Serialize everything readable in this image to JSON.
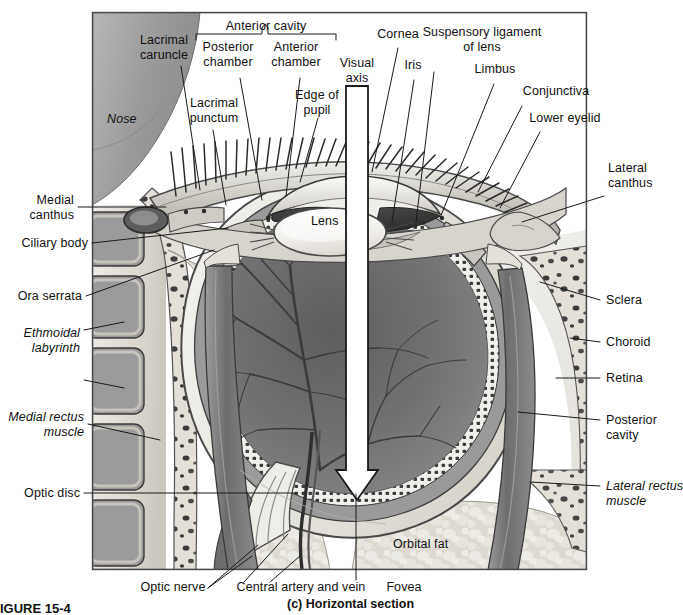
{
  "figure": {
    "number": "FIGURE 15-4",
    "caption": "(c) Horizontal section",
    "panel_letter": "(c)"
  },
  "diagram": {
    "frame": {
      "x": 92,
      "y": 12,
      "width": 495,
      "height": 558
    },
    "bracket_label": "Anterior cavity"
  },
  "labels": {
    "lacrimal_caruncle": "Lacrimal\ncaruncle",
    "lacrimal_punctum": "Lacrimal\npunctum",
    "nose": "Nose",
    "anterior_cavity": "Anterior cavity",
    "posterior_chamber": "Posterior\nchamber",
    "anterior_chamber": "Anterior\nchamber",
    "edge_of_pupil": "Edge of\npupil",
    "visual_axis": "Visual\naxis",
    "cornea": "Cornea",
    "iris": "Iris",
    "suspensory_ligament": "Suspensory ligament\nof lens",
    "limbus": "Limbus",
    "conjunctiva": "Conjunctiva",
    "lower_eyelid": "Lower eyelid",
    "lateral_canthus": "Lateral\ncanthus",
    "medial_canthus": "Medial\ncanthus",
    "ciliary_body": "Ciliary body",
    "ora_serrata": "Ora serrata",
    "ethmoidal_labyrinth": "Ethmoidal\nlabyrinth",
    "medial_rectus_muscle": "Medial rectus\nmuscle",
    "optic_disc": "Optic disc",
    "optic_nerve": "Optic nerve",
    "central_artery_and_vein": "Central artery and vein",
    "fovea": "Fovea",
    "orbital_fat": "Orbital fat",
    "lens": "Lens",
    "sclera": "Sclera",
    "choroid": "Choroid",
    "retina": "Retina",
    "posterior_cavity": "Posterior\ncavity",
    "lateral_rectus_muscle": "Lateral rectus\nmuscle"
  },
  "colors": {
    "page_background": "#ffffff",
    "text": "#111111",
    "leader_line": "#1a1a1a",
    "frame_border": "#4a4a4a",
    "vitreous_dark": "#6f6f6f",
    "vitreous_mid": "#8a8a8a",
    "sclera_light": "#e2e1dd",
    "bone_light": "#ded9d2",
    "muscle_gray": "#7d7d7d",
    "nose_gray": "#9a9a9a",
    "fat_light": "#d9d6cf",
    "lens_white": "#f2f0ec",
    "iris_dark": "#3b3b3b",
    "arrow_white": "#ffffff",
    "arrow_outline": "#1a1a1a"
  }
}
